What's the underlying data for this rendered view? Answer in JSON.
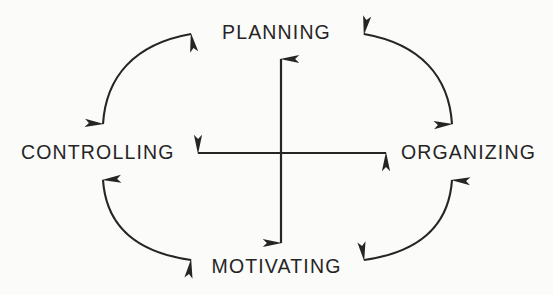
{
  "diagram": {
    "type": "cycle-diagram",
    "background_color": "#fbfbfa",
    "line_color": "#262524",
    "text_color": "#262524",
    "nodes": [
      {
        "id": "planning",
        "label": "PLANNING",
        "position": "top"
      },
      {
        "id": "organizing",
        "label": "ORGANIZING",
        "position": "right"
      },
      {
        "id": "motivating",
        "label": "MOTIVATING",
        "position": "bottom"
      },
      {
        "id": "controlling",
        "label": "CONTROLLING",
        "position": "left"
      }
    ],
    "connections": [
      {
        "id": "arc-top-left",
        "from": "controlling",
        "to": "planning",
        "style": "curved",
        "heads": "both"
      },
      {
        "id": "arc-top-right",
        "from": "organizing",
        "to": "planning",
        "style": "curved",
        "heads": "both"
      },
      {
        "id": "arc-bottom-left",
        "from": "controlling",
        "to": "motivating",
        "style": "curved",
        "heads": "both"
      },
      {
        "id": "arc-bottom-right",
        "from": "organizing",
        "to": "motivating",
        "style": "curved",
        "heads": "both"
      },
      {
        "id": "axis-vertical",
        "from": "motivating",
        "to": "planning",
        "style": "straight",
        "heads": "both"
      },
      {
        "id": "axis-horizontal",
        "from": "controlling",
        "to": "organizing",
        "style": "straight",
        "heads": "both"
      }
    ]
  }
}
